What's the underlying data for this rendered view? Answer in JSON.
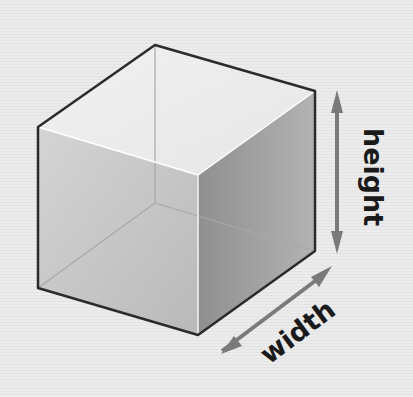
{
  "diagram": {
    "type": "3d-cube-dimensions",
    "labels": {
      "height": "height",
      "width": "width"
    },
    "colors": {
      "edge": "#2b2b2b",
      "arrow": "#7a7a7a",
      "text": "#1a1a1a"
    }
  }
}
